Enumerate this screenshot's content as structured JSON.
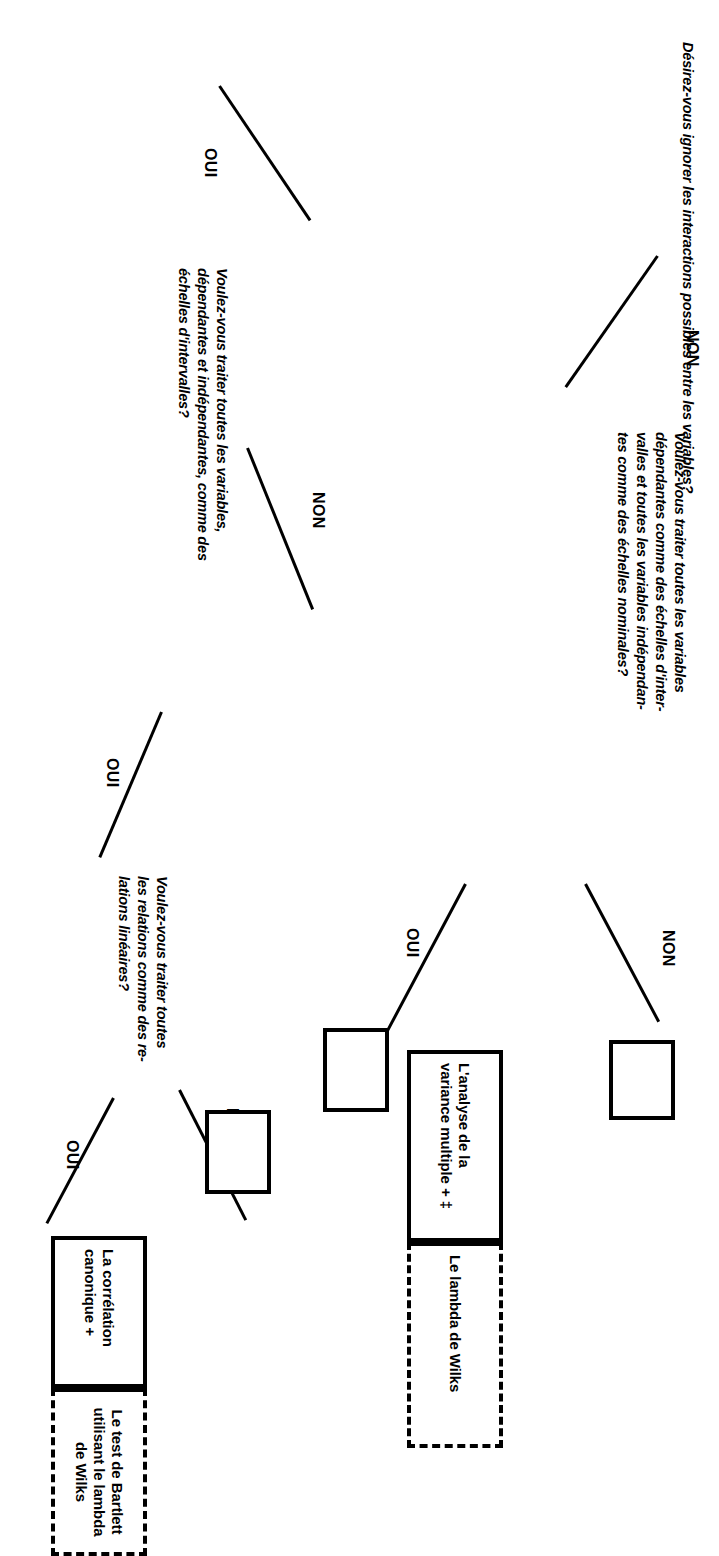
{
  "document": {
    "language": "fr",
    "kind": "decision-tree-flowchart",
    "orientation_note": "rotated-90-degrees",
    "ink_color": "#000000",
    "page_color": "#ffffff"
  },
  "title": {
    "text": "Désirez-vous ignorer les interactions possibles entre les variables?"
  },
  "branch_labels": {
    "oui": "OUI",
    "non": "NON"
  },
  "questions": [
    {
      "id": "q-interval-nominal",
      "text": "Voulez-vous traiter toutes les variables\ndépendantes comme des échelles d'inter-\nvalles et toutes les variables indépendan-\ntes comme des échelles nominales?"
    },
    {
      "id": "q-interval-scales",
      "text": "Voulez-vous traiter toutes les variables,\ndépendantes et indépendantes, comme des\néchelles d'intervalles?"
    },
    {
      "id": "q-linear-relations",
      "text": "Voulez-vous traiter toutes\nles relations comme des re-\nlations linéaires?"
    }
  ],
  "result_boxes": [
    {
      "id": "result-manova",
      "method": "L'analyse de la\nvariance multiple + ‡",
      "statistic": "Le lambda de Wilks"
    },
    {
      "id": "result-canonical",
      "method": "La corrélation\ncanonique +",
      "statistic": "Le test de Bartlett\nutilisant le lambda\nde Wilks"
    }
  ],
  "empty_boxes": [
    {
      "id": "empty-box-top",
      "text": ""
    },
    {
      "id": "empty-box-middle",
      "text": ""
    },
    {
      "id": "empty-box-bottom",
      "text": ""
    }
  ]
}
